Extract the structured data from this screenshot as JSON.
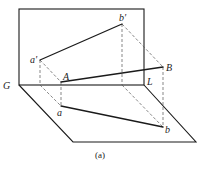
{
  "figure": {
    "caption": "(a)",
    "labels": {
      "G": "G",
      "L": "L",
      "A": "A",
      "B": "B",
      "a": "a",
      "b": "b",
      "a_prime": "a'",
      "b_prime": "b′"
    }
  },
  "geometry": {
    "vertical_plane": {
      "x1": 19,
      "y1": 9,
      "x2": 144,
      "y2": 85
    },
    "horizontal_plane": [
      [
        19,
        85
      ],
      [
        73,
        142
      ],
      [
        196,
        142
      ],
      [
        144,
        85
      ]
    ],
    "points": {
      "a_prime": [
        40,
        60
      ],
      "b_prime": [
        122,
        24
      ],
      "A": [
        61,
        82
      ],
      "B": [
        163,
        67
      ],
      "a": [
        61,
        106
      ],
      "b": [
        163,
        127
      ]
    }
  },
  "colors": {
    "line": "#1a1a1a",
    "dash": "#555555",
    "background": "#ffffff"
  }
}
